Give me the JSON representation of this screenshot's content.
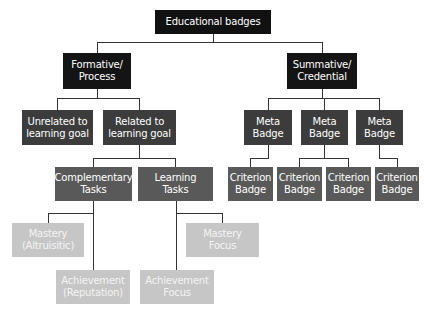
{
  "diagram": {
    "title": "Educational badges",
    "nodes": {
      "root": "Educational badges",
      "formative": "Formative/\nProcess",
      "summative": "Summative/\nCredential",
      "unrelated": "Unrelated to\nlearning goal",
      "related": "Related to\nlearning goal",
      "complementary": "Complementary\nTasks",
      "learning": "Learning\nTasks",
      "mastery_altruisitic": "Mastery\n(Altruisitic)",
      "achievement_reputation": "Achievement\n(Reputation)",
      "mastery_focus": "Mastery\nFocus",
      "achievement_focus": "Achievement\nFocus",
      "meta1": "Meta\nBadge",
      "meta2": "Meta\nBadge",
      "meta3": "Meta\nBadge",
      "crit1": "Criterion\nBadge",
      "crit2": "Criterion\nBadge",
      "crit3": "Criterion\nBadge",
      "crit4": "Criterion\nBadge"
    },
    "colors": {
      "level0": "#111111",
      "level1": "#141414",
      "level2": "#3c3c3c",
      "level3": "#595959",
      "level4": "#c6c6c6",
      "connector": "#333333"
    }
  }
}
